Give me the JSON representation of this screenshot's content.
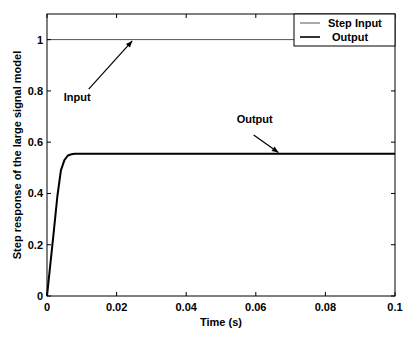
{
  "chart_data": {
    "type": "line",
    "title": "",
    "xlabel": "Time (s)",
    "ylabel": "Step response of the large signal model",
    "xlim": [
      0,
      0.1
    ],
    "ylim": [
      0,
      1.1
    ],
    "xticks": [
      0,
      0.02,
      0.04,
      0.06,
      0.08,
      0.1
    ],
    "xtick_labels": [
      "0",
      "0.02",
      "0.04",
      "0.06",
      "0.08",
      "0.1"
    ],
    "yticks": [
      0,
      0.2,
      0.4,
      0.6,
      0.8,
      1
    ],
    "ytick_labels": [
      "0",
      "0.2",
      "0.4",
      "0.6",
      "0.8",
      "1"
    ],
    "grid": false,
    "legend_position": "upper right",
    "series": [
      {
        "name": "Step Input",
        "color": "#555555",
        "line_width": 1,
        "x": [
          0,
          0.1
        ],
        "y": [
          1,
          1
        ]
      },
      {
        "name": "Output",
        "color": "#000000",
        "line_width": 2,
        "x": [
          0,
          0.001,
          0.002,
          0.003,
          0.004,
          0.005,
          0.006,
          0.007,
          0.008,
          0.01,
          0.02,
          0.05,
          0.1
        ],
        "y": [
          0,
          0.13,
          0.26,
          0.39,
          0.49,
          0.53,
          0.548,
          0.553,
          0.555,
          0.555,
          0.555,
          0.555,
          0.555
        ]
      }
    ],
    "annotations": [
      {
        "text": "Input",
        "text_x": 0.0048,
        "text_y": 0.76,
        "arrow_to": [
          0.0245,
          0.995
        ]
      },
      {
        "text": "Output",
        "text_x": 0.0545,
        "text_y": 0.675,
        "arrow_to": [
          0.0665,
          0.56
        ]
      }
    ]
  }
}
